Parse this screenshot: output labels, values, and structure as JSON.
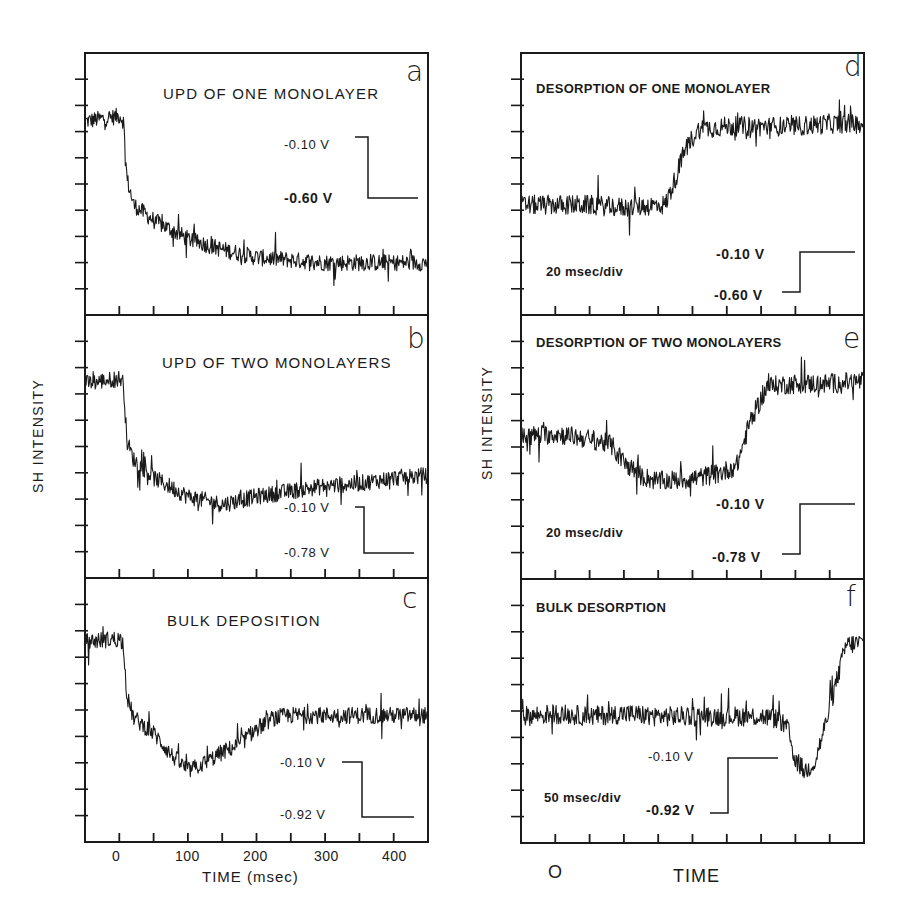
{
  "figure": {
    "left_column": {
      "y_axis_label": "SH INTENSITY",
      "x_axis_label": "TIME (msec)",
      "x_tick_labels": [
        "0",
        "100",
        "200",
        "300",
        "400"
      ]
    },
    "right_column": {
      "y_axis_label": "SH INTENSITY",
      "x_axis_label": "TIME",
      "x_zero_label": "O"
    },
    "panels": [
      {
        "id": "a",
        "letter": "a",
        "title": "UPD OF ONE MONOLAYER",
        "v_high": "-0.10 V",
        "v_low": "-0.60 V",
        "scale": ""
      },
      {
        "id": "b",
        "letter": "b",
        "title": "UPD OF TWO MONOLAYERS",
        "v_high": "-0.10 V",
        "v_low": "-0.78 V",
        "scale": ""
      },
      {
        "id": "c",
        "letter": "c",
        "title": "BULK DEPOSITION",
        "v_high": "-0.10 V",
        "v_low": "-0.92 V",
        "scale": ""
      },
      {
        "id": "d",
        "letter": "d",
        "title": "DESORPTION OF ONE MONOLAYER",
        "v_high": "-0.10 V",
        "v_low": "-0.60 V",
        "scale": "20 msec/div"
      },
      {
        "id": "e",
        "letter": "e",
        "title": "DESORPTION OF TWO MONOLAYERS",
        "v_high": "-0.10 V",
        "v_low": "-0.78 V",
        "scale": "20 msec/div"
      },
      {
        "id": "f",
        "letter": "f",
        "title": "BULK DESORPTION",
        "v_high": "-0.10 V",
        "v_low": "-0.92 V",
        "scale": "50 msec/div"
      }
    ]
  },
  "chart_data": [
    {
      "type": "line",
      "panel": "a",
      "title": "UPD OF ONE MONOLAYER",
      "xlabel": "TIME (msec)",
      "ylabel": "SH INTENSITY",
      "xlim": [
        -50,
        450
      ],
      "x_ticks": [
        0,
        50,
        100,
        150,
        200,
        250,
        300,
        350,
        400
      ],
      "y_units": "divisions (0=bottom, 10=top)",
      "ylim": [
        0,
        10
      ],
      "potential_step": {
        "from": "-0.10 V",
        "to": "-0.60 V"
      },
      "series": [
        {
          "name": "SH signal",
          "x": [
            -50,
            0,
            5,
            10,
            20,
            50,
            100,
            150,
            200,
            250,
            300,
            350,
            400,
            450
          ],
          "y": [
            7.4,
            7.6,
            7.4,
            5.2,
            4.2,
            3.6,
            2.9,
            2.5,
            2.2,
            2.1,
            2.0,
            2.0,
            2.0,
            2.0
          ]
        }
      ]
    },
    {
      "type": "line",
      "panel": "b",
      "title": "UPD OF TWO MONOLAYERS",
      "xlabel": "TIME (msec)",
      "ylabel": "SH INTENSITY",
      "xlim": [
        -50,
        450
      ],
      "x_ticks": [
        0,
        50,
        100,
        150,
        200,
        250,
        300,
        350,
        400
      ],
      "y_units": "divisions (0=bottom, 10=top)",
      "ylim": [
        0,
        10
      ],
      "potential_step": {
        "from": "-0.10 V",
        "to": "-0.78 V"
      },
      "series": [
        {
          "name": "SH signal",
          "x": [
            -50,
            0,
            5,
            10,
            20,
            50,
            100,
            150,
            200,
            250,
            300,
            350,
            400,
            450
          ],
          "y": [
            7.4,
            7.6,
            7.4,
            5.2,
            4.5,
            3.8,
            3.1,
            2.8,
            3.1,
            3.3,
            3.5,
            3.6,
            3.8,
            3.9
          ]
        }
      ]
    },
    {
      "type": "line",
      "panel": "c",
      "title": "BULK DEPOSITION",
      "xlabel": "TIME (msec)",
      "ylabel": "SH INTENSITY",
      "xlim": [
        -50,
        450
      ],
      "x_ticks": [
        0,
        50,
        100,
        150,
        200,
        250,
        300,
        350,
        400
      ],
      "y_units": "divisions (0=bottom, 10=top)",
      "ylim": [
        0,
        10
      ],
      "potential_step": {
        "from": "-0.10 V",
        "to": "-0.92 V"
      },
      "series": [
        {
          "name": "SH signal",
          "x": [
            -50,
            0,
            5,
            10,
            20,
            50,
            75,
            100,
            125,
            150,
            175,
            200,
            225,
            250,
            300,
            350,
            400,
            450
          ],
          "y": [
            7.6,
            7.7,
            7.5,
            5.5,
            4.7,
            4.1,
            3.3,
            2.7,
            3.0,
            3.4,
            3.7,
            4.3,
            4.7,
            4.8,
            4.8,
            4.8,
            4.8,
            4.8
          ]
        }
      ]
    },
    {
      "type": "line",
      "panel": "d",
      "title": "DESORPTION OF ONE MONOLAYER",
      "xlabel": "TIME",
      "ylabel": "SH INTENSITY",
      "x_units": "divisions (20 msec/div)",
      "xlim": [
        0,
        10
      ],
      "y_units": "divisions (0=bottom, 10=top)",
      "ylim": [
        0,
        10
      ],
      "potential_step": {
        "from": "-0.60 V",
        "to": "-0.10 V"
      },
      "series": [
        {
          "name": "SH signal",
          "x": [
            0,
            1,
            2,
            3,
            4,
            4.2,
            4.5,
            4.8,
            5.2,
            6,
            7,
            8,
            9,
            10
          ],
          "y": [
            4.2,
            4.2,
            4.2,
            4.1,
            4.2,
            4.2,
            5.2,
            6.4,
            7.1,
            7.2,
            7.2,
            7.2,
            7.3,
            7.3
          ]
        }
      ]
    },
    {
      "type": "line",
      "panel": "e",
      "title": "DESORPTION OF TWO MONOLAYERS",
      "xlabel": "TIME",
      "ylabel": "SH INTENSITY",
      "x_units": "divisions (20 msec/div)",
      "xlim": [
        0,
        10
      ],
      "y_units": "divisions (0=bottom, 10=top)",
      "ylim": [
        0,
        10
      ],
      "potential_step": {
        "from": "-0.78 V",
        "to": "-0.10 V"
      },
      "series": [
        {
          "name": "SH signal",
          "x": [
            0,
            1,
            2,
            2.6,
            3,
            3.5,
            4,
            5,
            5.8,
            6.3,
            6.7,
            7.2,
            8,
            9,
            10
          ],
          "y": [
            5.4,
            5.5,
            5.3,
            5.1,
            4.4,
            3.9,
            3.7,
            3.8,
            4.0,
            4.3,
            6.0,
            7.3,
            7.4,
            7.4,
            7.5
          ]
        }
      ]
    },
    {
      "type": "line",
      "panel": "f",
      "title": "BULK DESORPTION",
      "xlabel": "TIME",
      "ylabel": "SH INTENSITY",
      "x_units": "divisions (50 msec/div)",
      "xlim": [
        0,
        10
      ],
      "y_units": "divisions (0=bottom, 10=top)",
      "ylim": [
        0,
        10
      ],
      "potential_step": {
        "from": "-0.92 V",
        "to": "-0.10 V"
      },
      "series": [
        {
          "name": "SH signal",
          "x": [
            0,
            1,
            2,
            3,
            4,
            5,
            6,
            7,
            7.5,
            7.8,
            8.0,
            8.3,
            8.6,
            8.9,
            9.2,
            9.5,
            10
          ],
          "y": [
            4.8,
            4.9,
            4.8,
            4.9,
            4.8,
            4.8,
            4.8,
            4.8,
            4.7,
            4.3,
            3.2,
            2.7,
            3.1,
            4.5,
            6.0,
            7.5,
            7.6
          ]
        }
      ]
    }
  ],
  "layout": {
    "left": {
      "x0": 85,
      "x1": 428,
      "panels_y": [
        [
          53,
          315
        ],
        [
          315,
          578
        ],
        [
          578,
          842
        ]
      ],
      "xlim": [
        -50,
        450
      ],
      "ticks": [
        0,
        50,
        100,
        150,
        200,
        250,
        300,
        350,
        400
      ]
    },
    "right": {
      "x0": 521,
      "x1": 864,
      "panels_y": [
        [
          53,
          315
        ],
        [
          315,
          579
        ],
        [
          579,
          843
        ]
      ],
      "xlim": [
        0,
        10
      ],
      "ticks": [
        1,
        2,
        3,
        4,
        5,
        6,
        7,
        8,
        9
      ]
    },
    "stroke_color": "#1a1a1a"
  }
}
